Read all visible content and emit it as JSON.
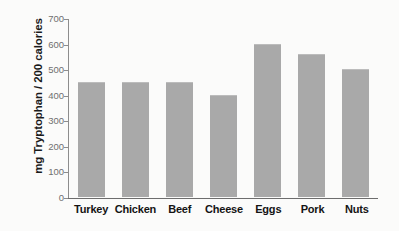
{
  "chart_data": {
    "type": "bar",
    "title": "",
    "xlabel": "",
    "ylabel": "mg Tryptophan / 200 calories",
    "categories": [
      "Turkey",
      "Chicken",
      "Beef",
      "Cheese",
      "Eggs",
      "Pork",
      "Nuts"
    ],
    "values": [
      450,
      450,
      450,
      400,
      600,
      560,
      500
    ],
    "ylim": [
      0,
      700
    ],
    "ytick_values": [
      0,
      100,
      200,
      300,
      400,
      500,
      600,
      700
    ],
    "ytick_labels": [
      "0",
      "100",
      "200",
      "300",
      "400",
      "500",
      "600",
      "700"
    ],
    "grid": false,
    "legend": null,
    "series": [
      {
        "name": "mg Tryptophan / 200 calories",
        "values": [
          450,
          450,
          450,
          400,
          600,
          560,
          500
        ]
      }
    ],
    "colors": {
      "bar_fill": "#a9a9a9",
      "axis": "#6d6d6d",
      "tick_text": "#6f6f6f",
      "label_text": "#141414",
      "background": "#fbfbfa"
    }
  }
}
